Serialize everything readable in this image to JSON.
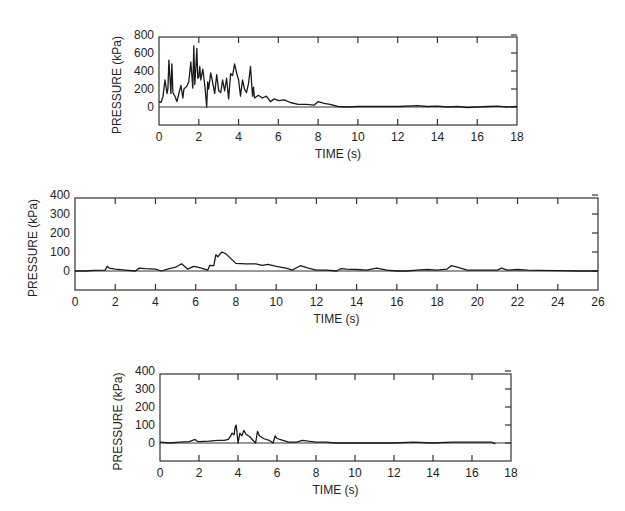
{
  "chart_data": [
    {
      "type": "line",
      "title": "",
      "xlabel": "TIME (s)",
      "ylabel": "PRESSURE (kPa)",
      "xlim": [
        0,
        18
      ],
      "ylim": [
        -200,
        800
      ],
      "xticks": [
        0,
        2,
        4,
        6,
        8,
        10,
        12,
        14,
        16,
        18
      ],
      "yticks": [
        0,
        200,
        400,
        600,
        800
      ],
      "grid": false,
      "zero_line": true,
      "frame": {
        "x0": 159,
        "x1": 517,
        "y_top": 37,
        "y_bottom": 125,
        "y_zero": 107
      },
      "series": [
        {
          "name": "pressure",
          "x": [
            0,
            0.1,
            0.2,
            0.3,
            0.4,
            0.45,
            0.5,
            0.6,
            0.65,
            0.7,
            0.8,
            0.9,
            1.0,
            1.1,
            1.2,
            1.25,
            1.3,
            1.4,
            1.5,
            1.6,
            1.7,
            1.75,
            1.8,
            1.85,
            1.9,
            1.95,
            2.0,
            2.05,
            2.1,
            2.2,
            2.3,
            2.4,
            2.45,
            2.5,
            2.6,
            2.7,
            2.8,
            2.9,
            3.0,
            3.1,
            3.2,
            3.3,
            3.4,
            3.5,
            3.6,
            3.7,
            3.8,
            3.9,
            4.0,
            4.1,
            4.2,
            4.3,
            4.4,
            4.5,
            4.6,
            4.7,
            4.75,
            4.8,
            5.0,
            5.2,
            5.4,
            5.6,
            5.8,
            6.0,
            6.3,
            6.6,
            7.0,
            7.4,
            7.8,
            8.0,
            8.3,
            8.6,
            9.0,
            9.5,
            10,
            11,
            12,
            13,
            13.5,
            14,
            14.5,
            15,
            15.5,
            16,
            16.5,
            17,
            17.5,
            18
          ],
          "y": [
            60,
            50,
            120,
            300,
            150,
            200,
            520,
            150,
            480,
            160,
            120,
            60,
            150,
            240,
            100,
            200,
            210,
            230,
            280,
            500,
            210,
            680,
            250,
            420,
            650,
            320,
            330,
            450,
            300,
            420,
            250,
            0,
            280,
            200,
            380,
            270,
            150,
            360,
            180,
            160,
            300,
            180,
            320,
            90,
            370,
            350,
            480,
            380,
            300,
            120,
            300,
            200,
            160,
            260,
            450,
            120,
            220,
            100,
            130,
            100,
            120,
            60,
            90,
            70,
            80,
            50,
            30,
            30,
            20,
            60,
            40,
            30,
            5,
            0,
            5,
            5,
            5,
            15,
            5,
            10,
            0,
            5,
            -5,
            0,
            5,
            10,
            0,
            5
          ]
        }
      ]
    },
    {
      "type": "line",
      "title": "",
      "xlabel": "TIME (s)",
      "ylabel": "PRESSURE (kPa)",
      "xlim": [
        0,
        26
      ],
      "ylim": [
        -100,
        400
      ],
      "xticks": [
        0,
        2,
        4,
        6,
        8,
        10,
        12,
        14,
        16,
        18,
        20,
        22,
        24,
        26
      ],
      "yticks": [
        0,
        100,
        200,
        300,
        400
      ],
      "grid": false,
      "zero_line": true,
      "frame": {
        "x0": 75,
        "x1": 598,
        "y_top": 198,
        "y_bottom": 290,
        "y_zero": 271
      },
      "series": [
        {
          "name": "pressure",
          "x": [
            0,
            0.5,
            1.0,
            1.5,
            1.6,
            1.7,
            2.0,
            2.5,
            3.0,
            3.2,
            3.5,
            4.0,
            4.3,
            4.6,
            5.0,
            5.3,
            5.6,
            5.9,
            6.2,
            6.6,
            6.7,
            6.9,
            7.0,
            7.1,
            7.3,
            7.5,
            7.8,
            8.0,
            8.5,
            9.0,
            9.3,
            9.6,
            10.0,
            10.5,
            10.8,
            11.2,
            11.6,
            12.0,
            12.5,
            13.0,
            13.2,
            13.5,
            14.0,
            14.5,
            15.0,
            15.5,
            16.0,
            16.5,
            17.0,
            17.5,
            18.0,
            18.5,
            18.7,
            19.0,
            19.5,
            20.0,
            20.5,
            21.0,
            21.2,
            21.5,
            22.0,
            22.5,
            23.0,
            24.0,
            25.0,
            26.0
          ],
          "y": [
            0,
            0,
            3,
            5,
            25,
            15,
            10,
            5,
            0,
            15,
            12,
            10,
            0,
            10,
            20,
            38,
            10,
            25,
            18,
            5,
            30,
            28,
            85,
            75,
            100,
            90,
            60,
            40,
            38,
            38,
            30,
            35,
            25,
            15,
            5,
            28,
            15,
            5,
            5,
            0,
            12,
            10,
            8,
            5,
            15,
            5,
            0,
            0,
            5,
            8,
            5,
            10,
            28,
            20,
            5,
            5,
            5,
            5,
            15,
            5,
            8,
            5,
            3,
            2,
            0,
            0
          ]
        }
      ]
    },
    {
      "type": "line",
      "title": "",
      "xlabel": "TIME (s)",
      "ylabel": "PRESSURE (kPa)",
      "xlim": [
        0,
        18
      ],
      "ylim": [
        -100,
        400
      ],
      "xticks": [
        0,
        2,
        4,
        6,
        8,
        10,
        12,
        14,
        16,
        18
      ],
      "yticks": [
        0,
        100,
        200,
        300,
        400
      ],
      "grid": false,
      "zero_line": true,
      "frame": {
        "x0": 160,
        "x1": 511,
        "y_top": 374,
        "y_bottom": 461,
        "y_zero": 443
      },
      "series": [
        {
          "name": "pressure",
          "x": [
            0,
            0.5,
            1.0,
            1.5,
            1.8,
            1.9,
            2.0,
            2.5,
            3.0,
            3.3,
            3.5,
            3.6,
            3.7,
            3.8,
            3.85,
            3.9,
            3.95,
            4.0,
            4.1,
            4.2,
            4.3,
            4.4,
            4.6,
            4.9,
            5.0,
            5.1,
            5.3,
            5.6,
            5.8,
            5.9,
            6.0,
            6.3,
            6.6,
            7.0,
            7.3,
            7.6,
            8.0,
            8.5,
            9.0,
            10,
            11,
            12,
            13,
            14,
            15,
            16,
            16.5,
            17.0,
            17.2
          ],
          "y": [
            5,
            0,
            5,
            8,
            20,
            10,
            8,
            10,
            15,
            15,
            20,
            35,
            55,
            45,
            85,
            100,
            60,
            0,
            55,
            40,
            70,
            50,
            35,
            0,
            65,
            40,
            25,
            15,
            0,
            40,
            25,
            15,
            5,
            5,
            15,
            10,
            5,
            5,
            0,
            0,
            0,
            0,
            5,
            0,
            5,
            5,
            5,
            5,
            -5
          ]
        }
      ]
    }
  ]
}
